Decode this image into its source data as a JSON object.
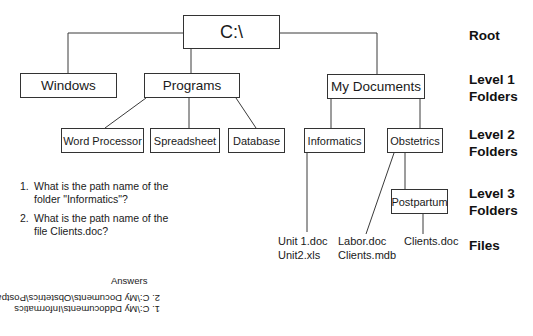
{
  "diagram": {
    "root": {
      "label": "C:\\"
    },
    "level1": [
      {
        "label": "Windows"
      },
      {
        "label": "Programs"
      },
      {
        "label": "My Documents"
      }
    ],
    "level2": [
      {
        "label": "Word Processor",
        "parent": "Programs"
      },
      {
        "label": "Spreadsheet",
        "parent": "Programs"
      },
      {
        "label": "Database",
        "parent": "Programs"
      },
      {
        "label": "Informatics",
        "parent": "My Documents"
      },
      {
        "label": "Obstetrics",
        "parent": "My Documents"
      }
    ],
    "level3": [
      {
        "label": "Postpartum",
        "parent": "Obstetrics"
      }
    ],
    "files": {
      "informatics": [
        "Unit 1.doc",
        "Unit2.xls"
      ],
      "obstetrics": [
        "Labor.doc",
        "Clients.mdb"
      ],
      "postpartum": [
        "Clients.doc"
      ]
    }
  },
  "level_labels": {
    "root": "Root",
    "level1_line1": "Level 1",
    "level1_line2": "Folders",
    "level2_line1": "Level 2",
    "level2_line2": "Folders",
    "level3_line1": "Level 3",
    "level3_line2": "Folders",
    "files": "Files"
  },
  "questions": [
    {
      "num": "1.",
      "text": "What is the path name of the folder \"Informatics\"?"
    },
    {
      "num": "2.",
      "text": "What is the path name of the file Clients.doc?"
    }
  ],
  "answers": {
    "title": "Answers",
    "items": [
      "1. C:\\My Dddocuments\\Informatics",
      "2. C:\\My Documents\\Obstetrics\\Postpartum\\Clients.doc"
    ],
    "orientation": "upside-down"
  }
}
